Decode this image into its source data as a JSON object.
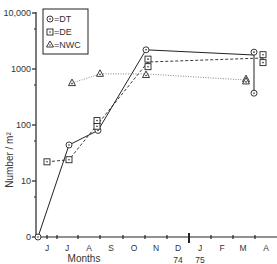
{
  "chart_data": {
    "type": "line",
    "title": "",
    "xlabel": "Months",
    "ylabel": "Number / m²",
    "yscale": "log",
    "y_ticks": [
      "0",
      "10",
      "100",
      "1000",
      "10,000"
    ],
    "x_ticks": [
      "J",
      "J",
      "A",
      "S",
      "O",
      "N",
      "D",
      "J",
      "F",
      "M",
      "A"
    ],
    "year_labels": [
      "74",
      "75"
    ],
    "legend": [
      {
        "marker": "circle-dot",
        "label": "=DT"
      },
      {
        "marker": "square-dot",
        "label": "=DE"
      },
      {
        "marker": "triangle-dot",
        "label": "=NWC"
      }
    ],
    "legend_position": "upper-left",
    "grid": false,
    "series": [
      {
        "name": "DT",
        "line_style": "solid",
        "points": [
          {
            "month": "May",
            "value": 0
          },
          {
            "month": "Jul",
            "value": 44
          },
          {
            "month": "Aug",
            "value": 80
          },
          {
            "month": "Nov",
            "value": 2200
          },
          {
            "month": "Apr",
            "value": 2000
          },
          {
            "month": "Apr",
            "value": 370
          }
        ]
      },
      {
        "name": "DE",
        "line_style": "dashed",
        "points": [
          {
            "month": "Jun",
            "value": 22
          },
          {
            "month": "Jul",
            "value": 24
          },
          {
            "month": "Aug",
            "value": 95
          },
          {
            "month": "Aug",
            "value": 120
          },
          {
            "month": "Nov",
            "value": 1100
          },
          {
            "month": "Nov",
            "value": 1500
          },
          {
            "month": "Apr",
            "value": 1800
          },
          {
            "month": "Apr",
            "value": 1300
          }
        ]
      },
      {
        "name": "NWC",
        "line_style": "dotted",
        "points": [
          {
            "month": "Jul",
            "value": 560
          },
          {
            "month": "Aug",
            "value": 820
          },
          {
            "month": "Nov",
            "value": 780
          },
          {
            "month": "Mar",
            "value": 660
          },
          {
            "month": "Mar",
            "value": 600
          }
        ]
      }
    ]
  }
}
